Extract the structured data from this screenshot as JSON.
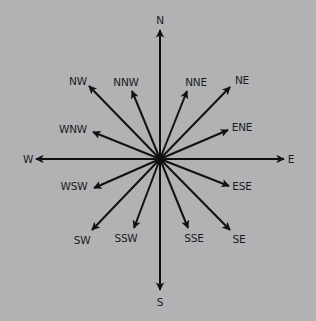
{
  "diagram": {
    "background_color": "#b2b2b4",
    "arrow_color": "#111111",
    "center": {
      "x": 160,
      "y": 159
    },
    "directions": [
      {
        "id": "n",
        "label": "N",
        "tip": [
          160,
          30
        ],
        "text": [
          160,
          24
        ],
        "anchor": "middle"
      },
      {
        "id": "nne",
        "label": "NNE",
        "tip": [
          187,
          91
        ],
        "text": [
          196,
          86
        ],
        "anchor": "middle"
      },
      {
        "id": "ne",
        "label": "NE",
        "tip": [
          230,
          87
        ],
        "text": [
          242,
          84
        ],
        "anchor": "middle"
      },
      {
        "id": "ene",
        "label": "ENE",
        "tip": [
          228,
          130
        ],
        "text": [
          242,
          131
        ],
        "anchor": "middle"
      },
      {
        "id": "e",
        "label": "E",
        "tip": [
          284,
          159
        ],
        "text": [
          291,
          163
        ],
        "anchor": "middle"
      },
      {
        "id": "ese",
        "label": "ESE",
        "tip": [
          229,
          186
        ],
        "text": [
          242,
          190
        ],
        "anchor": "middle"
      },
      {
        "id": "se",
        "label": "SE",
        "tip": [
          230,
          230
        ],
        "text": [
          239,
          243
        ],
        "anchor": "middle"
      },
      {
        "id": "sse",
        "label": "SSE",
        "tip": [
          188,
          228
        ],
        "text": [
          194,
          242
        ],
        "anchor": "middle"
      },
      {
        "id": "s",
        "label": "S",
        "tip": [
          160,
          290
        ],
        "text": [
          160,
          306
        ],
        "anchor": "middle"
      },
      {
        "id": "ssw",
        "label": "SSW",
        "tip": [
          134,
          228
        ],
        "text": [
          126,
          242
        ],
        "anchor": "middle"
      },
      {
        "id": "sw",
        "label": "SW",
        "tip": [
          92,
          230
        ],
        "text": [
          82,
          244
        ],
        "anchor": "middle"
      },
      {
        "id": "wsw",
        "label": "WSW",
        "tip": [
          94,
          188
        ],
        "text": [
          74,
          190
        ],
        "anchor": "middle"
      },
      {
        "id": "w",
        "label": "W",
        "tip": [
          36,
          159
        ],
        "text": [
          28,
          163
        ],
        "anchor": "middle"
      },
      {
        "id": "wnw",
        "label": "WNW",
        "tip": [
          93,
          132
        ],
        "text": [
          73,
          133
        ],
        "anchor": "middle"
      },
      {
        "id": "nw",
        "label": "NW",
        "tip": [
          89,
          86
        ],
        "text": [
          78,
          85
        ],
        "anchor": "middle"
      },
      {
        "id": "nnw",
        "label": "NNW",
        "tip": [
          132,
          91
        ],
        "text": [
          126,
          86
        ],
        "anchor": "middle"
      }
    ]
  }
}
